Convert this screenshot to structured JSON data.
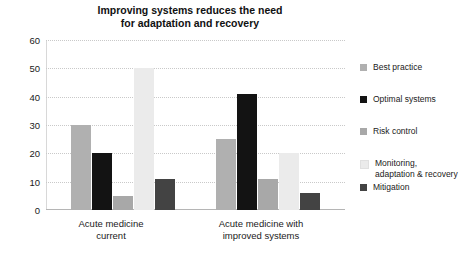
{
  "chart_data": {
    "type": "bar",
    "title": "Improving systems reduces the need for adaptation and recovery",
    "title_lines": [
      "Improving systems reduces the need",
      "for adaptation and recovery"
    ],
    "xlabel": "",
    "ylabel": "",
    "ylim": [
      0,
      60
    ],
    "yticks": [
      0,
      10,
      20,
      30,
      40,
      50,
      60
    ],
    "ytick_labels": [
      "0",
      "10",
      "20",
      "30",
      "40",
      "50",
      "60"
    ],
    "grid": true,
    "grid_style": "dotted-horizontal",
    "legend_position": "right",
    "categories": [
      "Acute medicine current",
      "Acute medicine with improved systems"
    ],
    "category_lines": [
      [
        "Acute medicine",
        "current"
      ],
      [
        "Acute medicine with",
        "improved systems"
      ]
    ],
    "series": [
      {
        "name": "Best practice",
        "color": "#b0b0b0",
        "values": [
          30,
          25
        ]
      },
      {
        "name": "Optimal systems",
        "color": "#131313",
        "values": [
          20,
          41
        ]
      },
      {
        "name": "Risk control",
        "color": "#a8a8a8",
        "values": [
          5,
          11
        ]
      },
      {
        "name": "Monitoring, adaptation & recovery",
        "color": "#ebebeb",
        "values": [
          50,
          20
        ]
      },
      {
        "name": "Mitigation",
        "color": "#434343",
        "values": [
          11,
          6
        ]
      }
    ],
    "legend_entries": [
      {
        "label": "Best practice",
        "color": "#b0b0b0"
      },
      {
        "label": "Optimal systems",
        "color": "#131313"
      },
      {
        "label": "Risk control",
        "color": "#a8a8a8"
      },
      {
        "label": "Monitoring,\nadaptation & recovery",
        "color": "#ebebeb"
      },
      {
        "label": "Mitigation",
        "color": "#434343"
      }
    ]
  }
}
